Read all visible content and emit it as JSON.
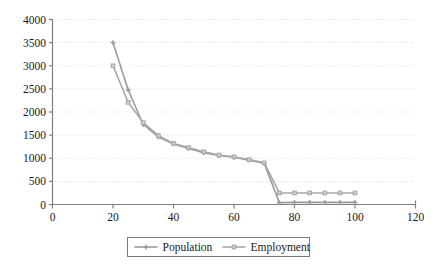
{
  "chart_data": {
    "type": "line",
    "title": "",
    "xlabel": "",
    "ylabel": "",
    "xlim": [
      0,
      120
    ],
    "ylim": [
      0,
      4000
    ],
    "xticks": [
      0,
      20,
      40,
      60,
      80,
      100,
      120
    ],
    "yticks": [
      0,
      500,
      1000,
      1500,
      2000,
      2500,
      3000,
      3500,
      4000
    ],
    "grid": "horizontal-dotted",
    "legend_position": "bottom-center",
    "x": [
      20,
      25,
      30,
      35,
      40,
      45,
      50,
      55,
      60,
      65,
      70,
      75,
      80,
      85,
      90,
      95,
      100
    ],
    "series": [
      {
        "name": "Population",
        "marker": "cross",
        "color": "#9a9a9a",
        "values": [
          3500,
          2480,
          1730,
          1460,
          1310,
          1210,
          1120,
          1060,
          1020,
          960,
          890,
          40,
          45,
          45,
          45,
          45,
          45
        ]
      },
      {
        "name": "Employment",
        "marker": "square",
        "color": "#a8a8a8",
        "values": [
          3000,
          2210,
          1770,
          1490,
          1320,
          1230,
          1140,
          1070,
          1030,
          970,
          900,
          250,
          250,
          250,
          250,
          250,
          250
        ]
      }
    ],
    "axis_color": "#808080",
    "gridline_color": "#d9d9d9",
    "text_color": "#1a1a1a"
  },
  "legend": {
    "items": [
      {
        "label": "Population",
        "marker": "cross-marker-icon"
      },
      {
        "label": "Employment",
        "marker": "square-marker-icon"
      }
    ]
  },
  "axis": {
    "y_labels": [
      "0",
      "500",
      "1000",
      "1500",
      "2000",
      "2500",
      "3000",
      "3500",
      "4000"
    ],
    "x_labels": [
      "0",
      "20",
      "40",
      "60",
      "80",
      "100",
      "120"
    ]
  }
}
